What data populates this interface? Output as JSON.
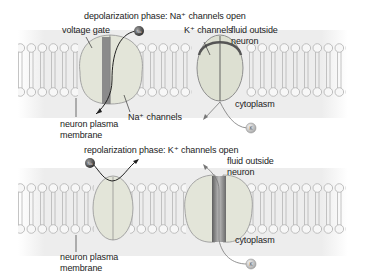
{
  "panels": [
    {
      "id": "depolarization",
      "title": "depolarization phase: Na⁺ channels open",
      "labels": {
        "voltage_gate": "voltage gate",
        "k_channels": "K⁺ channels",
        "fluid_outside_1": "fluid outside",
        "fluid_outside_2": "neuron",
        "na_channels": "Na⁺ channels",
        "membrane_1": "neuron plasma",
        "membrane_2": "membrane",
        "cytoplasm": "cytoplasm"
      },
      "ions": [
        {
          "symbol": "Na⁺",
          "position": "outside, entering Na channel"
        },
        {
          "symbol": "K⁺",
          "position": "cytoplasm"
        }
      ],
      "channel_states": {
        "na_channel": "open",
        "k_channel": "closed"
      }
    },
    {
      "id": "repolarization",
      "title": "repolarization phase: K⁺ channels open",
      "labels": {
        "fluid_outside_1": "fluid outside",
        "fluid_outside_2": "neuron",
        "membrane_1": "neuron plasma",
        "membrane_2": "membrane",
        "cytoplasm": "cytoplasm"
      },
      "ions": [
        {
          "symbol": "Na⁺",
          "position": "outside, blocked"
        },
        {
          "symbol": "K⁺",
          "position": "cytoplasm, exiting via K channel"
        }
      ],
      "channel_states": {
        "na_channel": "closed",
        "k_channel": "open"
      }
    }
  ],
  "ion_badges": {
    "na": "Na",
    "k": "K"
  },
  "colors": {
    "background": "#ffffff",
    "band": "#eeeeee",
    "lipid_head": "#f6f6f6",
    "lipid_head_stroke": "#b8b8b8",
    "channel_fill": "#e4e6da",
    "channel_stroke": "#9a9a9a",
    "pore_dark": "#7a7a7a",
    "ion_na": "#4a4a4a",
    "ion_k": "#bdbdbd"
  }
}
